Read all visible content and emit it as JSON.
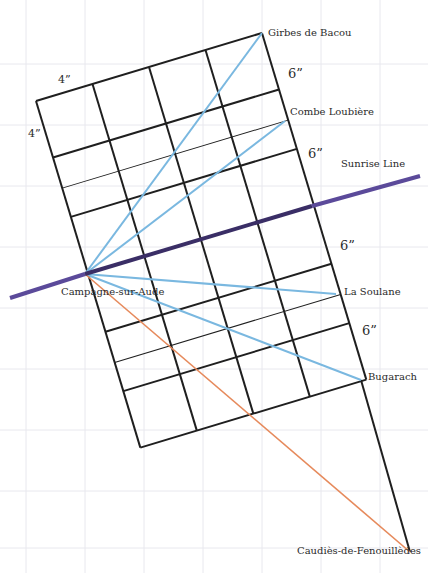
{
  "diagram": {
    "colors": {
      "background": "#ffffff",
      "paper_grid": "#e8e8ee",
      "grid_line": "#1f1f1f",
      "sight_line": "#7ab8e0",
      "orange_line": "#e68a5c",
      "sunrise_line": "#5b4a9a"
    },
    "dimension_labels": {
      "top_width": "4”",
      "left_height": "4”",
      "right_1": "6”",
      "right_2": "6”",
      "right_3": "6”",
      "right_4": "6”"
    },
    "places": {
      "girbes": "Girbes de Bacou",
      "combe": "Combe Loubière",
      "sunrise": "Sunrise Line",
      "campagne": "Campagne-sur-Aude",
      "soulane": "La Soulane",
      "bugarach": "Bugarach",
      "caudies": "Caudiès-de-Fenouillèdes"
    },
    "points": {
      "girbes": [
        262,
        33
      ],
      "combe": [
        285,
        121
      ],
      "campagne": [
        85,
        274
      ],
      "soulane": [
        336,
        294
      ],
      "bugarach": [
        361,
        380
      ],
      "caudies": [
        410,
        552
      ]
    }
  }
}
